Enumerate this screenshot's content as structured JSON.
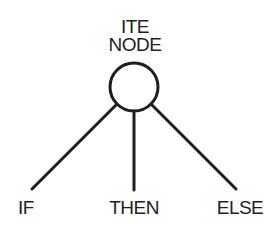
{
  "diagram": {
    "root": {
      "label_line1": "ITE",
      "label_line2": "NODE",
      "cx": 134,
      "cy": 87,
      "r": 24
    },
    "children": [
      {
        "label": "IF",
        "x": 32,
        "y": 189,
        "text_x": 26
      },
      {
        "label": "THEN",
        "x": 134,
        "y": 190,
        "text_x": 134
      },
      {
        "label": "ELSE",
        "x": 236,
        "y": 189,
        "text_x": 240
      }
    ],
    "stroke_color": "#1e1e1e",
    "background": "#ffffff"
  }
}
